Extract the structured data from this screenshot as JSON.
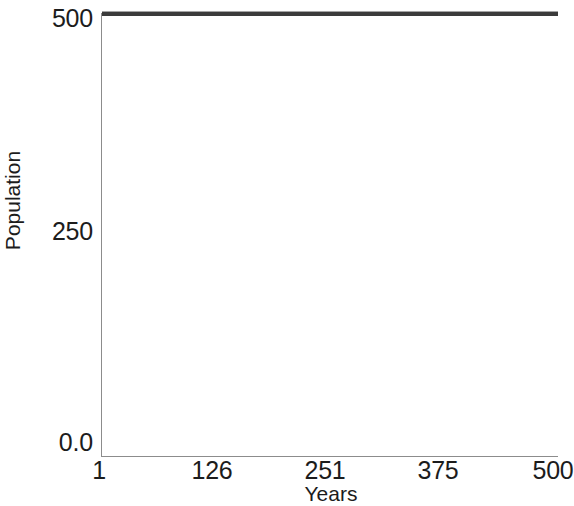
{
  "chart_data": {
    "type": "line",
    "title": "",
    "subtitle": "",
    "xlabel": "Years",
    "ylabel": "Population",
    "xlim": [
      1,
      500
    ],
    "ylim": [
      0.0,
      510
    ],
    "grid": false,
    "legend": null,
    "legend_position": "none",
    "xticks": [
      {
        "value": 1,
        "label": "1",
        "px": 99
      },
      {
        "value": 126,
        "label": "126",
        "px": 212
      },
      {
        "value": 251,
        "label": "251",
        "px": 325
      },
      {
        "value": 375,
        "label": "375",
        "px": 438
      },
      {
        "value": 500,
        "label": "500",
        "px": 553
      }
    ],
    "yticks": [
      {
        "value": 0.0,
        "label": "0.0",
        "px": 443
      },
      {
        "value": 250,
        "label": "250",
        "px": 232
      },
      {
        "value": 500,
        "label": "500",
        "px": 19
      }
    ],
    "series": [
      {
        "name": "Population",
        "color": "#3b3b3b",
        "line_width": 4,
        "x": [
          1,
          63,
          126,
          188,
          251,
          313,
          375,
          438,
          500
        ],
        "values": [
          510,
          510,
          510,
          510,
          510,
          510,
          510,
          510,
          510
        ],
        "constant_value": 510,
        "description": "flat horizontal line, population constant at carrying capacity across all 500 years"
      }
    ],
    "annotations": []
  },
  "axes": {
    "y_title": "Population",
    "x_title": "Years",
    "y_tick_labels": [
      "500",
      "250",
      "0.0"
    ],
    "x_tick_labels": [
      "1",
      "126",
      "251",
      "375",
      "500"
    ],
    "axis_color": "#8c8c8c",
    "text_color": "#1c1c1c",
    "background": "#ffffff"
  }
}
